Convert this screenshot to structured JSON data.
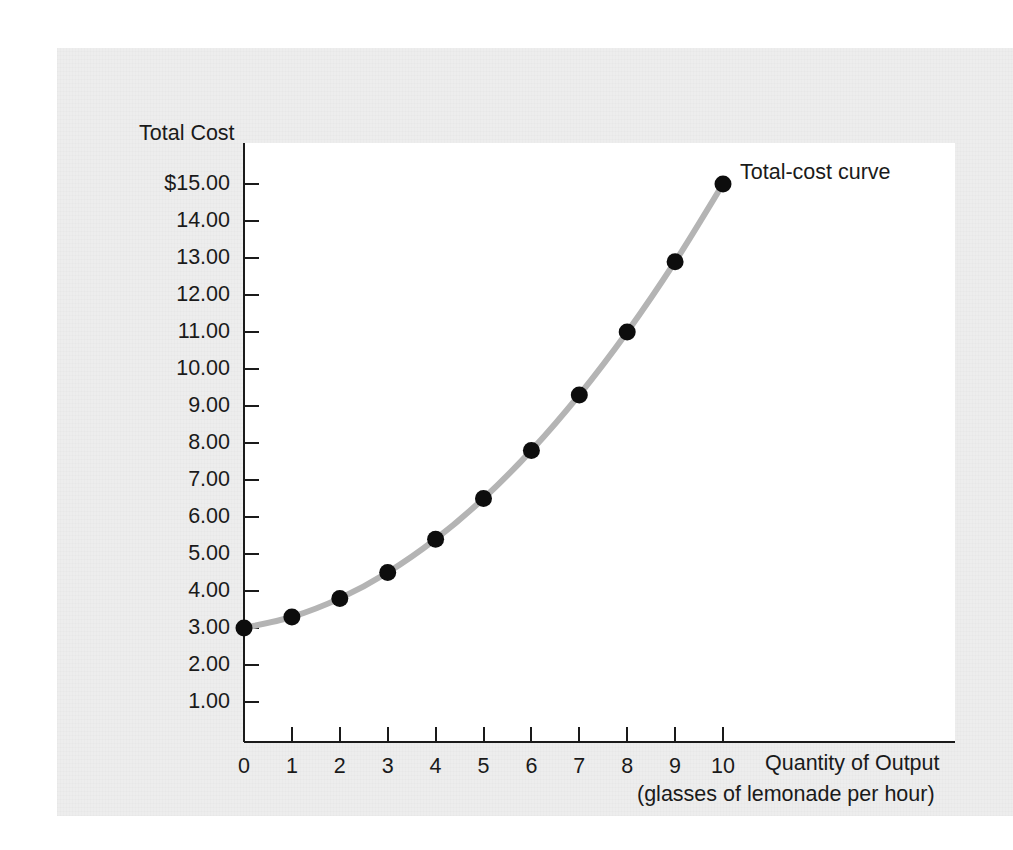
{
  "figure": {
    "y_axis_title": "Total Cost",
    "x_axis_title_line1": "Quantity of Output",
    "x_axis_title_line2": "(glasses of lemonade per hour)",
    "curve_annotation": "Total-cost curve",
    "curve_color": "#b4b4b4",
    "point_color": "#0d0d0d",
    "axis_color": "#1a1a1a",
    "panel_color": "#ededed",
    "plot_background": "#ffffff"
  },
  "chart_data": {
    "type": "line",
    "title": "",
    "xlabel": "Quantity of Output (glasses of lemonade per hour)",
    "ylabel": "Total Cost",
    "xlim": [
      0,
      11
    ],
    "ylim": [
      0,
      15.6
    ],
    "grid": false,
    "legend_position": "inline-right-of-last-point",
    "series": [
      {
        "name": "Total-cost curve",
        "x": [
          0,
          1,
          2,
          3,
          4,
          5,
          6,
          7,
          8,
          9,
          10
        ],
        "values": [
          3.0,
          3.3,
          3.8,
          4.5,
          5.4,
          6.5,
          7.8,
          9.3,
          11.0,
          12.9,
          15.0
        ]
      }
    ],
    "x_tick_labels": [
      "0",
      "1",
      "2",
      "3",
      "4",
      "5",
      "6",
      "7",
      "8",
      "9",
      "10"
    ],
    "x_ticks": [
      0,
      1,
      2,
      3,
      4,
      5,
      6,
      7,
      8,
      9,
      10
    ],
    "y_tick_labels": [
      "$15.00",
      "14.00",
      "13.00",
      "12.00",
      "11.00",
      "10.00",
      "9.00",
      "8.00",
      "7.00",
      "6.00",
      "5.00",
      "4.00",
      "3.00",
      "2.00",
      "1.00"
    ],
    "y_ticks": [
      15,
      14,
      13,
      12,
      11,
      10,
      9,
      8,
      7,
      6,
      5,
      4,
      3,
      2,
      1
    ],
    "annotations": [
      {
        "text": "Total-cost curve",
        "x": 10,
        "y": 15.0
      }
    ]
  }
}
